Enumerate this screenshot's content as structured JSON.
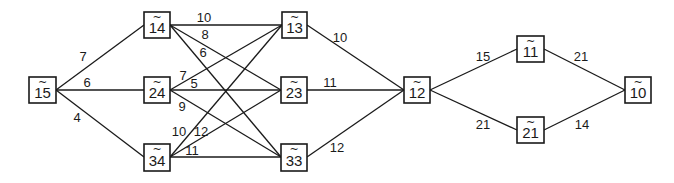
{
  "diagram": {
    "type": "weighted-network",
    "nodes": [
      {
        "id": "15",
        "label": "15",
        "tilde": "~",
        "x": 29,
        "y": 77,
        "w": 27,
        "h": 26
      },
      {
        "id": "14",
        "label": "14",
        "tilde": "~",
        "x": 144,
        "y": 12,
        "w": 26,
        "h": 26
      },
      {
        "id": "24",
        "label": "24",
        "tilde": "~",
        "x": 144,
        "y": 77,
        "w": 26,
        "h": 26
      },
      {
        "id": "34",
        "label": "34",
        "tilde": "~",
        "x": 144,
        "y": 144,
        "w": 26,
        "h": 27
      },
      {
        "id": "13",
        "label": "13",
        "tilde": "~",
        "x": 282,
        "y": 12,
        "w": 25,
        "h": 26
      },
      {
        "id": "23",
        "label": "23",
        "tilde": "~",
        "x": 281,
        "y": 77,
        "w": 26,
        "h": 26
      },
      {
        "id": "33",
        "label": "33",
        "tilde": "~",
        "x": 281,
        "y": 144,
        "w": 26,
        "h": 27
      },
      {
        "id": "12",
        "label": "12",
        "tilde": "~",
        "x": 404,
        "y": 77,
        "w": 26,
        "h": 26
      },
      {
        "id": "11",
        "label": "11",
        "tilde": "~",
        "x": 517,
        "y": 36,
        "w": 27,
        "h": 26
      },
      {
        "id": "21",
        "label": "21",
        "tilde": "~",
        "x": 517,
        "y": 117,
        "w": 27,
        "h": 26
      },
      {
        "id": "10",
        "label": "10",
        "tilde": "~",
        "x": 625,
        "y": 77,
        "w": 26,
        "h": 26
      }
    ],
    "edges": [
      {
        "from": "15",
        "to": "14",
        "weight": "7",
        "x1": 56,
        "y1": 90,
        "x2": 144,
        "y2": 25,
        "lx": 83,
        "ly": 61
      },
      {
        "from": "15",
        "to": "24",
        "weight": "6",
        "x1": 56,
        "y1": 90,
        "x2": 144,
        "y2": 90,
        "lx": 87,
        "ly": 87
      },
      {
        "from": "15",
        "to": "34",
        "weight": "4",
        "x1": 56,
        "y1": 90,
        "x2": 144,
        "y2": 157,
        "lx": 77,
        "ly": 122
      },
      {
        "from": "14",
        "to": "13",
        "weight": "10",
        "x1": 170,
        "y1": 25,
        "x2": 282,
        "y2": 25,
        "lx": 204,
        "ly": 22
      },
      {
        "from": "14",
        "to": "23",
        "weight": "8",
        "x1": 170,
        "y1": 25,
        "x2": 281,
        "y2": 90,
        "lx": 205,
        "ly": 39
      },
      {
        "from": "14",
        "to": "33",
        "weight": "6",
        "x1": 170,
        "y1": 25,
        "x2": 281,
        "y2": 157,
        "lx": 203,
        "ly": 57
      },
      {
        "from": "24",
        "to": "13",
        "weight": "7",
        "x1": 170,
        "y1": 90,
        "x2": 282,
        "y2": 25,
        "lx": 183,
        "ly": 80
      },
      {
        "from": "24",
        "to": "23",
        "weight": "5",
        "x1": 170,
        "y1": 90,
        "x2": 281,
        "y2": 90,
        "lx": 194,
        "ly": 88
      },
      {
        "from": "24",
        "to": "33",
        "weight": "9",
        "x1": 170,
        "y1": 90,
        "x2": 281,
        "y2": 157,
        "lx": 182,
        "ly": 111
      },
      {
        "from": "34",
        "to": "13",
        "weight": "10",
        "x1": 170,
        "y1": 157,
        "x2": 282,
        "y2": 25,
        "lx": 179,
        "ly": 136
      },
      {
        "from": "34",
        "to": "23",
        "weight": "12",
        "x1": 170,
        "y1": 157,
        "x2": 281,
        "y2": 90,
        "lx": 201,
        "ly": 136
      },
      {
        "from": "34",
        "to": "33",
        "weight": "11",
        "x1": 170,
        "y1": 157,
        "x2": 281,
        "y2": 157,
        "lx": 192,
        "ly": 155
      },
      {
        "from": "13",
        "to": "12",
        "weight": "10",
        "x1": 307,
        "y1": 25,
        "x2": 404,
        "y2": 90,
        "lx": 340,
        "ly": 42
      },
      {
        "from": "23",
        "to": "12",
        "weight": "11",
        "x1": 307,
        "y1": 90,
        "x2": 404,
        "y2": 90,
        "lx": 330,
        "ly": 87
      },
      {
        "from": "33",
        "to": "12",
        "weight": "12",
        "x1": 307,
        "y1": 157,
        "x2": 404,
        "y2": 90,
        "lx": 337,
        "ly": 152
      },
      {
        "from": "12",
        "to": "11",
        "weight": "15",
        "x1": 430,
        "y1": 90,
        "x2": 517,
        "y2": 49,
        "lx": 483,
        "ly": 61
      },
      {
        "from": "12",
        "to": "21",
        "weight": "21",
        "x1": 430,
        "y1": 90,
        "x2": 517,
        "y2": 130,
        "lx": 483,
        "ly": 129
      },
      {
        "from": "11",
        "to": "10",
        "weight": "21",
        "x1": 544,
        "y1": 49,
        "x2": 625,
        "y2": 90,
        "lx": 581,
        "ly": 61
      },
      {
        "from": "21",
        "to": "10",
        "weight": "14",
        "x1": 544,
        "y1": 130,
        "x2": 625,
        "y2": 90,
        "lx": 582,
        "ly": 129
      }
    ]
  }
}
